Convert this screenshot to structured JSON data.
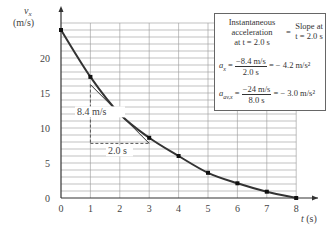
{
  "chart_data": {
    "type": "line",
    "title": "",
    "xlabel": "t (s)",
    "ylabel": "v_x (m/s)",
    "xlim": [
      0,
      8
    ],
    "ylim": [
      0,
      25
    ],
    "grid": true,
    "x_ticks": [
      "0",
      "1",
      "2",
      "3",
      "4",
      "5",
      "6",
      "7",
      "8"
    ],
    "y_ticks": [
      "0",
      "5",
      "10",
      "15",
      "20"
    ],
    "series": [
      {
        "name": "v_x(t)",
        "x": [
          0,
          1,
          2,
          3,
          4,
          5,
          6,
          7,
          8
        ],
        "values": [
          24,
          17.3,
          12,
          8.6,
          6,
          3.6,
          2.1,
          0.9,
          0
        ]
      }
    ],
    "annotations": {
      "tangent_rise": "8.4 m/s",
      "tangent_run": "2.0 s",
      "box": {
        "line1_left": "Instantaneous",
        "line2_left": "acceleration",
        "line3_left": "at t = 2.0 s",
        "equals": "=",
        "right1": "Slope at",
        "right2": "t = 2.0 s",
        "ax_label": "a",
        "ax_sub": "x",
        "ax_num": "−8.4 m/s",
        "ax_den": "2.0 s",
        "ax_result": "= − 4.2 m/s²",
        "aav_label": "a",
        "aav_sub": "av,x",
        "aav_num": "−24 m/s",
        "aav_den": "8.0 s",
        "aav_result": "= − 3.0 m/s²"
      }
    }
  }
}
